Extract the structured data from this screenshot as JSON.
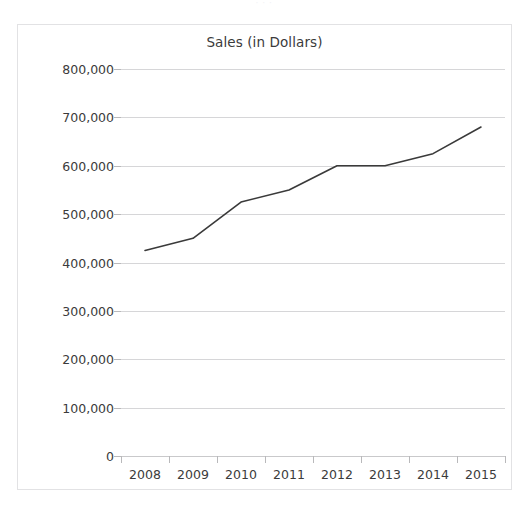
{
  "top_remnant": {
    "text": "·   ·  ·"
  },
  "chart_data": {
    "type": "line",
    "title": "Sales (in Dollars)",
    "xlabel": "",
    "ylabel": "",
    "categories": [
      "2008",
      "2009",
      "2010",
      "2011",
      "2012",
      "2013",
      "2014",
      "2015"
    ],
    "values": [
      425000,
      450000,
      525000,
      550000,
      600000,
      600000,
      625000,
      680000
    ],
    "series": [
      {
        "name": "Sales (in Dollars)",
        "values": [
          425000,
          450000,
          525000,
          550000,
          600000,
          600000,
          625000,
          680000
        ]
      }
    ],
    "ylim": [
      0,
      800000
    ],
    "ytick_values": [
      0,
      100000,
      200000,
      300000,
      400000,
      500000,
      600000,
      700000,
      800000
    ],
    "ytick_labels": [
      "0",
      "100,000",
      "200,000",
      "300,000",
      "400,000",
      "500,000",
      "600,000",
      "700,000",
      "800,000"
    ],
    "xtick_labels": [
      "2008",
      "2009",
      "2010",
      "2011",
      "2012",
      "2013",
      "2014",
      "2015"
    ],
    "grid": true,
    "grid_axis": "y",
    "legend": false,
    "legend_position": "none",
    "markers": false,
    "line_color": "#3a3a3a",
    "grid_color": "#d6d6d8",
    "text_color": "#3b3b3b",
    "border_color": "#e2e2e4",
    "background_color": "#ffffff"
  }
}
